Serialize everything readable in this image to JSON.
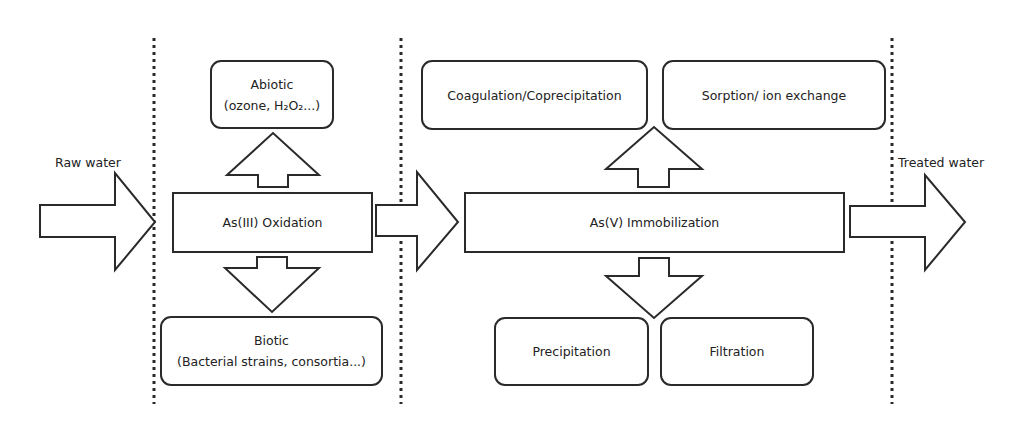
{
  "diagram": {
    "flow_labels": {
      "input": "Raw water",
      "output": "Treated water"
    },
    "oxidation": {
      "label": "As(III) Oxidation",
      "abiotic": {
        "title": "Abiotic",
        "detail": "(ozone, H₂O₂...)"
      },
      "biotic": {
        "title": "Biotic",
        "detail": "(Bacterial strains, consortia...)"
      }
    },
    "immobilization": {
      "label": "As(V) Immobilization",
      "upper_methods": [
        {
          "label": "Coagulation/Coprecipitation"
        },
        {
          "label": "Sorption/ ion exchange"
        }
      ],
      "lower_methods": [
        {
          "label": "Precipitation"
        },
        {
          "label": "Filtration"
        }
      ]
    },
    "icons": {
      "flow_arrows": [
        "arrow-right-icon",
        "arrow-right-icon",
        "arrow-right-icon"
      ],
      "branch_arrows": [
        "arrow-up-icon",
        "arrow-down-icon",
        "arrow-up-icon",
        "arrow-down-icon"
      ],
      "stage_separators": [
        "dotted-divider",
        "dotted-divider",
        "dotted-divider"
      ]
    }
  },
  "colors": {
    "background": "#ffffff",
    "stroke": "#2a2a2a",
    "text": "#222222"
  }
}
